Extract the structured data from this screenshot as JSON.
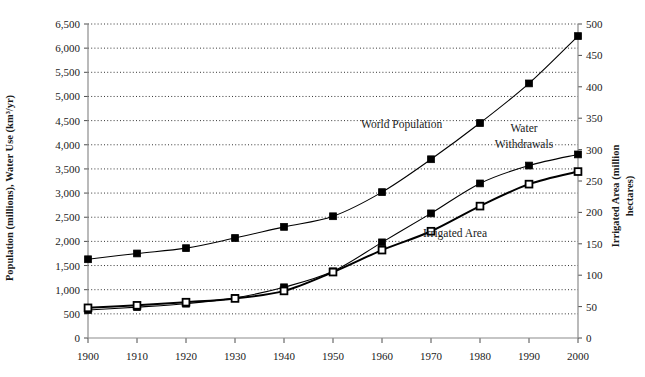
{
  "axes": {
    "left_title": "Population (millions), Water Use (km³/yr)",
    "right_title_line1": "Irrigated Area (million",
    "right_title_line2": "hectares)",
    "left_ticks": [
      "0",
      "500",
      "1,000",
      "1,500",
      "2,000",
      "2,500",
      "3,000",
      "3,500",
      "4,000",
      "4,500",
      "5,000",
      "5,500",
      "6,000",
      "6,500"
    ],
    "right_ticks": [
      "0",
      "50",
      "100",
      "150",
      "200",
      "250",
      "300",
      "350",
      "400",
      "450",
      "500"
    ],
    "x_ticks": [
      "1900",
      "1910",
      "1920",
      "1930",
      "1940",
      "1950",
      "1960",
      "1970",
      "1980",
      "1990",
      "2000"
    ]
  },
  "labels": {
    "world_population": "World Population",
    "water_withdrawals_line1": "Water",
    "water_withdrawals_line2": "Withdrawals",
    "irrigated_area": "Irrigated Area"
  },
  "chart_data": {
    "type": "line",
    "title": "",
    "xlabel": "",
    "ylabel": "Population (millions), Water Use (km³/yr)",
    "ylabel_right": "Irrigated Area (million hectares)",
    "xlim": [
      1900,
      2000
    ],
    "ylim": [
      0,
      6500
    ],
    "ylim_right": [
      0,
      500
    ],
    "grid": true,
    "legend": "inline-annotations",
    "series": [
      {
        "name": "World Population",
        "axis": "left",
        "units": "millions",
        "marker": "filled-square",
        "x": [
          1900,
          1910,
          1920,
          1930,
          1940,
          1950,
          1960,
          1970,
          1980,
          1990,
          2000
        ],
        "y": [
          1630,
          1750,
          1860,
          2070,
          2300,
          2520,
          3020,
          3700,
          4450,
          5270,
          6250
        ]
      },
      {
        "name": "Water Withdrawals",
        "axis": "left",
        "units": "km³/yr",
        "marker": "filled-square",
        "x": [
          1900,
          1910,
          1920,
          1930,
          1940,
          1950,
          1960,
          1970,
          1980,
          1990,
          2000
        ],
        "y": [
          580,
          640,
          710,
          830,
          1050,
          1380,
          1980,
          2580,
          3200,
          3570,
          3800
        ]
      },
      {
        "name": "Irrigated Area",
        "axis": "right",
        "units": "million hectares",
        "marker": "hollow-square",
        "x": [
          1900,
          1910,
          1920,
          1930,
          1940,
          1950,
          1960,
          1970,
          1980,
          1990,
          2000
        ],
        "y": [
          48,
          52,
          57,
          63,
          75,
          105,
          140,
          170,
          210,
          245,
          265
        ]
      }
    ]
  }
}
